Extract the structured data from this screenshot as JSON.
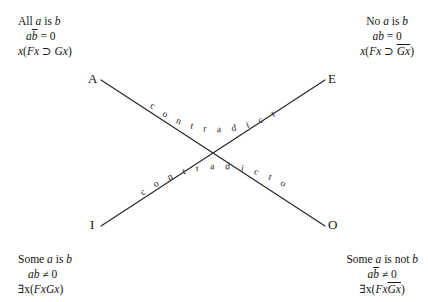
{
  "diagram": {
    "background_color": "#ffffff",
    "line_color": "#2a2a2a",
    "text_color": "#161616"
  },
  "corners": {
    "a": {
      "letter": "A",
      "sentence_pre": "All ",
      "sentence_var1": "a",
      "sentence_mid": " is ",
      "sentence_var2": "b",
      "algebra_v1": "a",
      "algebra_v2": "b",
      "algebra_rest": " = 0",
      "logic_quant": "x",
      "logic_open": "(",
      "logic_f": "Fx",
      "logic_op": " ⊃ ",
      "logic_g": "Gx",
      "logic_close": ")"
    },
    "e": {
      "letter": "E",
      "sentence_pre": "No ",
      "sentence_var1": "a",
      "sentence_mid": " is ",
      "sentence_var2": "b",
      "algebra_v1": "ab",
      "algebra_rest": " = 0",
      "logic_quant": "x",
      "logic_open": "(",
      "logic_f": "Fx",
      "logic_op": " ⊃ ",
      "logic_g": "Gx",
      "logic_close": ")"
    },
    "i": {
      "letter": "I",
      "sentence_pre": "Some ",
      "sentence_var1": "a",
      "sentence_mid": " is ",
      "sentence_var2": "b",
      "algebra_v1": "ab",
      "algebra_rest": " ≠ 0",
      "logic_quant": "∃x",
      "logic_open": "(",
      "logic_f": "Fx",
      "logic_g": "Gx",
      "logic_close": ")"
    },
    "o": {
      "letter": "O",
      "sentence_pre": "Some ",
      "sentence_var1": "a",
      "sentence_mid": " is not ",
      "sentence_var2": "b",
      "algebra_v1": "a",
      "algebra_v2": "b",
      "algebra_rest": " ≠ 0",
      "logic_quant": "∃x",
      "logic_open": "(",
      "logic_f": "Fx",
      "logic_g": "Gx",
      "logic_close": ")"
    }
  },
  "relations": {
    "upper_label": "c o n t r a d i c t o r i e s",
    "lower_label": "c o n t r a d i c t o r i e s"
  }
}
